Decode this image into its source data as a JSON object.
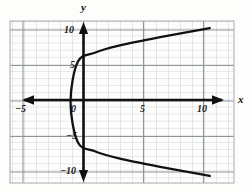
{
  "figure": {
    "background_color": "#fdfdfb",
    "grid_color": "#b9bcc4",
    "grid_major_color": "#8d919b",
    "axis_color": "#111111",
    "curve_color": "#111111"
  },
  "axes": {
    "x_label": "x",
    "y_label": "y",
    "x_ticks": [
      {
        "value": -5,
        "label": "−5"
      },
      {
        "value": 0,
        "label": "0"
      },
      {
        "value": 5,
        "label": "5"
      },
      {
        "value": 10,
        "label": "10"
      }
    ],
    "y_ticks": [
      {
        "value": 10,
        "label": "10"
      },
      {
        "value": 5,
        "label": "5"
      },
      {
        "value": -5,
        "label": "−5"
      },
      {
        "value": -10,
        "label": "−10"
      }
    ],
    "x_range": [
      -6,
      12.5
    ],
    "y_range": [
      -11.5,
      11.5
    ],
    "grid": true,
    "grid_step": 1,
    "arrowheads": [
      "left",
      "right",
      "up",
      "down"
    ]
  },
  "chart_data": {
    "type": "line",
    "title": "",
    "xlabel": "x",
    "ylabel": "y",
    "grid": true,
    "legend": null,
    "xlim": [
      -6,
      12.5
    ],
    "ylim": [
      -11.5,
      11.5
    ],
    "curve": {
      "name": "sideways parabola",
      "equation": "x = y^2/25 - 1",
      "opens": "right",
      "vertex": [
        -1,
        0
      ],
      "y_intercepts": [
        5,
        -5
      ],
      "points": [
        [
          10.5,
          -10.5
        ],
        [
          6.4,
          -9.2
        ],
        [
          3.0,
          -8.0
        ],
        [
          1.0,
          -7.0
        ],
        [
          -0.4,
          -5.7
        ],
        [
          -1.0,
          0.0
        ],
        [
          -0.4,
          5.7
        ],
        [
          1.0,
          7.0
        ],
        [
          3.0,
          8.0
        ],
        [
          6.4,
          9.2
        ],
        [
          10.5,
          10.5
        ]
      ]
    }
  }
}
